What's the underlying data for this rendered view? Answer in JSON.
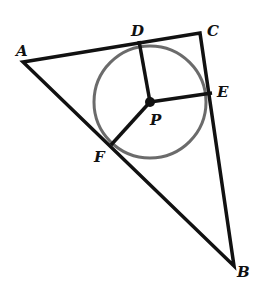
{
  "diagram": {
    "type": "geometry",
    "points": {
      "A": {
        "label": "A",
        "x": 23,
        "y": 62
      },
      "B": {
        "label": "B",
        "x": 234,
        "y": 266
      },
      "C": {
        "label": "C",
        "x": 200,
        "y": 33
      },
      "D": {
        "label": "D",
        "x": 139,
        "y": 41
      },
      "E": {
        "label": "E",
        "x": 212,
        "y": 93
      },
      "F": {
        "label": "F",
        "x": 111,
        "y": 145
      },
      "P": {
        "label": "P",
        "x": 150,
        "y": 102
      }
    },
    "circle": {
      "center": "P",
      "radius": 56,
      "color": "#6b6b6b"
    },
    "line_color": "#111111"
  }
}
